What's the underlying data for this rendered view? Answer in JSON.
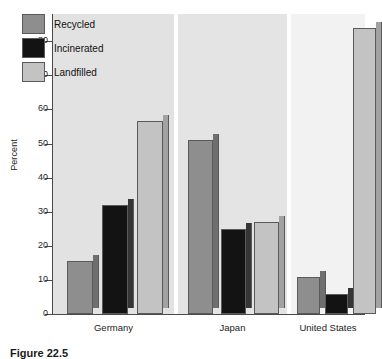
{
  "chart_data": {
    "type": "bar",
    "title": "",
    "subtitle": "",
    "xlabel": "",
    "ylabel": "Percent",
    "ylim": [
      0,
      88
    ],
    "yticks": [
      0,
      10,
      20,
      30,
      40,
      50,
      60,
      70,
      80
    ],
    "ytick_labels": [
      "0",
      "10",
      "20",
      "30",
      "40",
      "50",
      "60",
      "70",
      "80"
    ],
    "grid": false,
    "legend_position": "top-left",
    "categories": [
      "Germany",
      "Japan",
      "United States"
    ],
    "series": [
      {
        "name": "Recycled",
        "color": "#8e8e8e",
        "values": [
          15.5,
          51,
          11
        ]
      },
      {
        "name": "Incinerated",
        "color": "#131313",
        "values": [
          32,
          25,
          6
        ]
      },
      {
        "name": "Landfilled",
        "color": "#c3c3c3",
        "values": [
          56.5,
          27,
          84
        ]
      }
    ]
  },
  "legend": {
    "items": [
      {
        "label": "Recycled",
        "swatch": "recycled"
      },
      {
        "label": "Incinerated",
        "swatch": "incinerated"
      },
      {
        "label": "Landfilled",
        "swatch": "landfilled"
      }
    ]
  },
  "caption": {
    "text": "Figure 22.5"
  },
  "colors": {
    "recycled": "#8e8e8e",
    "incinerated": "#131313",
    "landfilled": "#c3c3c3",
    "axis": "#4a4a4a",
    "panel_1_bg": "#e2e2e2",
    "panel_2_bg": "#e4e4e4",
    "panel_3_bg": "#f2f2f2"
  }
}
